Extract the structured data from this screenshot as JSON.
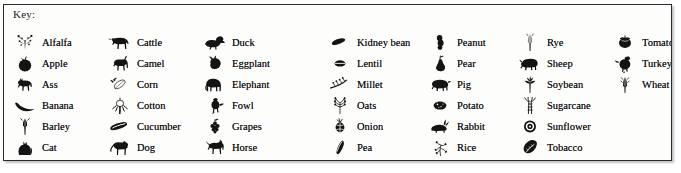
{
  "panel": {
    "title": "Key:",
    "border_color": "#2b2b2b",
    "background_color": "#fdfdfc",
    "ink_color": "#141414"
  },
  "columns": [
    {
      "entries": [
        {
          "label": "Alfalfa",
          "icon": "alfalfa-sprig-icon"
        },
        {
          "label": "Apple",
          "icon": "apple-icon"
        },
        {
          "label": "Ass",
          "icon": "donkey-icon"
        },
        {
          "label": "Banana",
          "icon": "banana-icon"
        },
        {
          "label": "Barley",
          "icon": "barley-stalk-icon"
        },
        {
          "label": "Cat",
          "icon": "cat-icon"
        }
      ]
    },
    {
      "entries": [
        {
          "label": "Cattle",
          "icon": "cow-icon"
        },
        {
          "label": "Camel",
          "icon": "camel-icon"
        },
        {
          "label": "Corn",
          "icon": "corn-cob-icon"
        },
        {
          "label": "Cotton",
          "icon": "cotton-boll-icon"
        },
        {
          "label": "Cucumber",
          "icon": "cucumber-icon"
        },
        {
          "label": "Dog",
          "icon": "dog-icon"
        }
      ]
    },
    {
      "entries": [
        {
          "label": "Duck",
          "icon": "duck-icon"
        },
        {
          "label": "Eggplant",
          "icon": "eggplant-icon"
        },
        {
          "label": "Elephant",
          "icon": "elephant-icon"
        },
        {
          "label": "Fowl",
          "icon": "fowl-icon"
        },
        {
          "label": "Grapes",
          "icon": "grapes-icon"
        },
        {
          "label": "Horse",
          "icon": "horse-icon"
        }
      ]
    },
    {
      "entries": [
        {
          "label": "Kidney bean",
          "icon": "kidney-bean-icon"
        },
        {
          "label": "Lentil",
          "icon": "lentil-icon"
        },
        {
          "label": "Millet",
          "icon": "millet-spray-icon"
        },
        {
          "label": "Oats",
          "icon": "oat-sprig-icon"
        },
        {
          "label": "Onion",
          "icon": "onion-icon"
        },
        {
          "label": "Pea",
          "icon": "pea-pod-icon"
        }
      ]
    },
    {
      "entries": [
        {
          "label": "Peanut",
          "icon": "peanut-icon"
        },
        {
          "label": "Pear",
          "icon": "pear-icon"
        },
        {
          "label": "Pig",
          "icon": "pig-icon"
        },
        {
          "label": "Potato",
          "icon": "potato-icon"
        },
        {
          "label": "Rabbit",
          "icon": "rabbit-icon"
        },
        {
          "label": "Rice",
          "icon": "rice-sprig-icon"
        }
      ]
    },
    {
      "entries": [
        {
          "label": "Rye",
          "icon": "rye-ear-icon"
        },
        {
          "label": "Sheep",
          "icon": "sheep-icon"
        },
        {
          "label": "Soybean",
          "icon": "soybean-plant-icon"
        },
        {
          "label": "Sugarcane",
          "icon": "sugarcane-icon"
        },
        {
          "label": "Sunflower",
          "icon": "sunflower-icon"
        },
        {
          "label": "Tobacco",
          "icon": "tobacco-leaf-icon"
        }
      ]
    },
    {
      "entries": [
        {
          "label": "Tomato",
          "icon": "tomato-icon"
        },
        {
          "label": "Turkey",
          "icon": "turkey-icon"
        },
        {
          "label": "Wheat",
          "icon": "wheat-ear-icon"
        }
      ]
    }
  ]
}
